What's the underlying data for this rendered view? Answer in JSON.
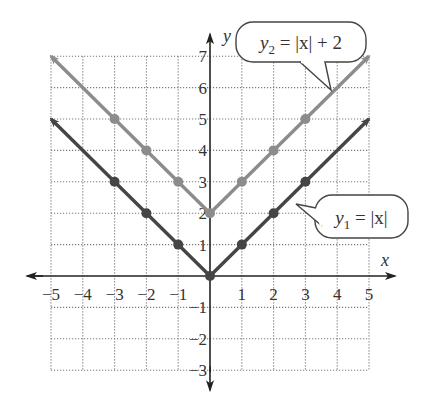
{
  "chart_data": {
    "type": "line",
    "title": "",
    "xlabel": "x",
    "ylabel": "y",
    "xlim": [
      -5,
      5
    ],
    "ylim": [
      -3,
      7
    ],
    "grid": true,
    "x_ticks": [
      -5,
      -4,
      -3,
      -2,
      -1,
      1,
      2,
      3,
      4,
      5
    ],
    "x_tick_labels": [
      "−5",
      "−4",
      "−3",
      "−2",
      "−1",
      "1",
      "2",
      "3",
      "4",
      "5"
    ],
    "y_ticks": [
      -3,
      -2,
      -1,
      1,
      2,
      3,
      4,
      5,
      6,
      7
    ],
    "y_tick_labels": [
      "−3",
      "−2",
      "−1",
      "1",
      "2",
      "3",
      "4",
      "5",
      "6",
      "7"
    ],
    "x": [
      -5,
      -4,
      -3,
      -2,
      -1,
      0,
      1,
      2,
      3,
      4,
      5
    ],
    "series": [
      {
        "name": "y1 = |x|",
        "label": "y₁ = |x|",
        "color": "#454545",
        "values": [
          5,
          4,
          3,
          2,
          1,
          0,
          1,
          2,
          3,
          4,
          5
        ],
        "marked_points": [
          [
            -3,
            3
          ],
          [
            -2,
            2
          ],
          [
            -1,
            1
          ],
          [
            0,
            0
          ],
          [
            1,
            1
          ],
          [
            2,
            2
          ],
          [
            3,
            3
          ]
        ]
      },
      {
        "name": "y2 = |x| + 2",
        "label": "y₂ = |x| + 2",
        "color": "#8c8c8c",
        "values": [
          7,
          6,
          5,
          4,
          3,
          2,
          3,
          4,
          5,
          6,
          7
        ],
        "marked_points": [
          [
            -3,
            5
          ],
          [
            -2,
            4
          ],
          [
            -1,
            3
          ],
          [
            0,
            2
          ],
          [
            1,
            3
          ],
          [
            2,
            4
          ],
          [
            3,
            5
          ]
        ]
      }
    ],
    "annotations": [
      {
        "text": "y₂ = |x| + 2",
        "points_to": [
          3.6,
          5.6
        ],
        "position": "top-right"
      },
      {
        "text": "y₁ = |x|",
        "points_to": [
          2.7,
          2.7
        ],
        "position": "right"
      }
    ],
    "legend": "callouts"
  },
  "axes": {
    "x_label": "x",
    "y_label": "y"
  },
  "callouts": {
    "y2": {
      "base": "y",
      "sub": "2",
      "rest": " = |x| + 2"
    },
    "y1": {
      "base": "y",
      "sub": "1",
      "rest": " = |x|"
    }
  }
}
